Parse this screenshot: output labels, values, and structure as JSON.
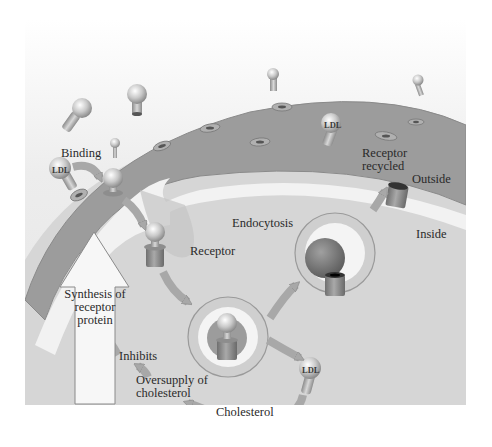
{
  "diagram": {
    "title": "",
    "topic": "LDL receptor-mediated endocytosis and feedback regulation of receptor synthesis",
    "regions": {
      "outside": "Outside",
      "inside": "Inside"
    },
    "labels": {
      "binding": "Binding",
      "ldl_binding": "LDL",
      "ldl_membrane": "LDL",
      "ldl_released": "LDL",
      "receptor": "Receptor",
      "endocytosis": "Endocytosis",
      "receptor_recycled_line1": "Receptor",
      "receptor_recycled_line2": "recycled",
      "synthesis_line1": "Synthesis of",
      "synthesis_line2": "receptor",
      "synthesis_line3": "protein",
      "inhibits": "Inhibits",
      "oversupply_line1": "Oversupply of",
      "oversupply_line2": "cholesterol",
      "cholesterol": "Cholesterol"
    },
    "colors": {
      "background": "#ffffff",
      "extracellular": "#eeeeee",
      "membrane": "#9a9a9a",
      "membrane_inner_band": "#f2f2f2",
      "cytoplasm": "#d4d4d4",
      "arrow": "#a8a8a8",
      "synthesis_arrow_fill": "#f7f7f7",
      "text": "#2a2a2a"
    }
  }
}
